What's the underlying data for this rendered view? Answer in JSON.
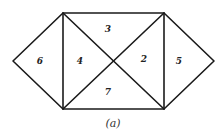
{
  "diagram": {
    "caption": "(a)",
    "regions": [
      {
        "id": "6",
        "label": "6"
      },
      {
        "id": "4",
        "label": "4"
      },
      {
        "id": "3",
        "label": "3"
      },
      {
        "id": "2",
        "label": "2"
      },
      {
        "id": "5",
        "label": "5"
      },
      {
        "id": "7",
        "label": "7"
      }
    ],
    "line_color": "#1a1a1a",
    "background": "#ffffff"
  }
}
